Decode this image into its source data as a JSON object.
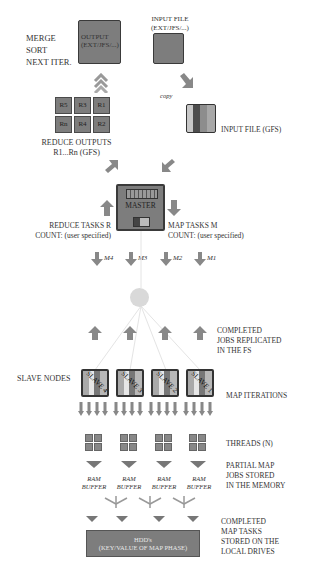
{
  "top": {
    "merge_sort_lines": [
      "MERGE",
      "SORT",
      "NEXT ITER."
    ],
    "output_box": {
      "line1": "OUTPUT",
      "line2": "(EXT/JFS/...)"
    },
    "input_file_label": {
      "line1": "INPUT FILE",
      "line2": "(EXT/JFS/...)"
    },
    "copy_label": "copy",
    "input_file_gfs_label": "INPUT FILE (GFS)"
  },
  "reduce_outputs": {
    "cells": [
      "R5",
      "R3",
      "R1",
      "Rn",
      "R4",
      "R2"
    ],
    "label_line1": "REDUCE OUTPUTS",
    "label_line2": "R1...Rn (GFS)"
  },
  "master": {
    "label": "MASTER",
    "reduce_tasks_line1": "REDUCE TASKS R",
    "reduce_tasks_line2": "COUNT:  (user specified)",
    "map_tasks_line1": "MAP TASKS M",
    "map_tasks_line2": "COUNT:  (user specified)"
  },
  "map_tasks": [
    "M4",
    "M3",
    "M2",
    "M1"
  ],
  "completed_jobs_label": [
    "COMPLETED",
    "JOBS REPLICATED",
    "IN THE FS"
  ],
  "slave_nodes_label": "SLAVE NODES",
  "slaves": [
    "SLAVE 4",
    "SLAVE 3",
    "SLAVE 2",
    "SLAVE 1"
  ],
  "map_iterations_label": "MAP ITERATIONS",
  "threads_label": "THREADS (N)",
  "partial_map_label": [
    "PARTIAL MAP",
    "JOBS STORED",
    "IN THE MEMORY"
  ],
  "ram_buffers": [
    {
      "line1": "RAM",
      "line2": "BUFFER"
    },
    {
      "line1": "RAM",
      "line2": "BUFFER"
    },
    {
      "line1": "RAM",
      "line2": "BUFFER"
    },
    {
      "line1": "RAM",
      "line2": "BUFFER"
    }
  ],
  "hdd": {
    "line1": "HDD's",
    "line2": "(KEY/VALUE OF MAP PHASE)"
  },
  "completed_map_label": [
    "COMPLETED",
    "MAP TASKS",
    "STORED ON THE",
    "LOCAL DRIVES"
  ],
  "colors": {
    "box": "#7d7d7d",
    "border": "#3a3a3a",
    "arrow": "#888888",
    "circle": "#d9d9d9",
    "text": "#333333"
  }
}
